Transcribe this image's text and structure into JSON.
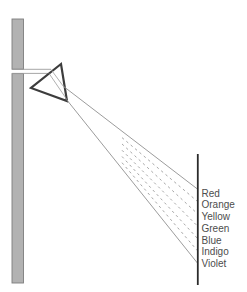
{
  "diagram": {
    "name": "prism-light-dispersion",
    "spectrum_labels": [
      "Red",
      "Orange",
      "Yellow",
      "Green",
      "Blue",
      "Indigo",
      "Violet"
    ],
    "colors": {
      "background": "#ffffff",
      "wall_fill": "#b2b2b2",
      "wall_border": "#7d7d7d",
      "prism_stroke": "#3d3d3d",
      "prism_fill": "#ffffff",
      "ray_stroke": "#9c9c9c",
      "screen_stroke": "#2b2b2b",
      "label_color": "#4d4d4d"
    },
    "geometry": {
      "canvas": {
        "width": 247,
        "height": 292
      },
      "wall": {
        "x": 12,
        "y": 19,
        "width": 11.5,
        "bottom": 283,
        "slit_top": 69.2,
        "slit_bottom": 73.6
      },
      "beam": {
        "x_start": 12,
        "top_y": 69.3,
        "top_x_end": 51,
        "bottom_y": 73.4,
        "bottom_x_end": 49
      },
      "prism": {
        "points": [
          [
            61,
            64
          ],
          [
            31,
            88
          ],
          [
            67,
            101
          ]
        ]
      },
      "interior_rays": [
        [
          51,
          69.5,
          63.5,
          86.5
        ],
        [
          49,
          73.4,
          66.5,
          99
        ]
      ],
      "fan": {
        "origin_top": [
          63,
          86
        ],
        "origin_bottom": [
          66.5,
          99.5
        ],
        "end_x": 197.4,
        "end_y_top": 189,
        "end_y_bottom": 263,
        "dash_start_x": 122,
        "dash_pattern": "2.5 3.2"
      },
      "screen": {
        "x": 197.8,
        "y1": 154,
        "y2": 285
      },
      "labels": {
        "x": 201.5,
        "y_start": 193,
        "y_step": 11.75,
        "font_size": 10
      }
    }
  }
}
